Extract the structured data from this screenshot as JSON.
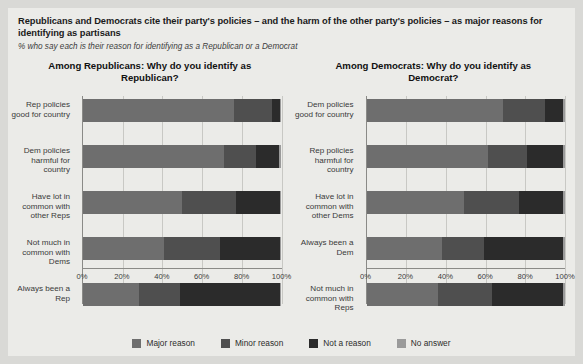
{
  "header": {
    "title": "Republicans and Democrats cite their party's policies – and the harm of the other party's policies – as major reasons for identifying as partisans",
    "subtitle": "% who say each is their reason for identifying as a Republican or a Democrat"
  },
  "colors": {
    "major_reason": "#6e6e6e",
    "minor_reason": "#4f4f4f",
    "not_a_reason": "#2b2b2b",
    "no_answer": "#9a9a9a",
    "panel_background": "#ebebe8",
    "page_background": "#d9d9d6",
    "axis": "#8a8a87",
    "gridline": "#c8c8c4"
  },
  "legend": {
    "position": "bottom",
    "items": [
      {
        "label": "Major reason",
        "color": "#6e6e6e",
        "key": "major_reason"
      },
      {
        "label": "Minor reason",
        "color": "#4f4f4f",
        "key": "minor_reason"
      },
      {
        "label": "Not a reason",
        "color": "#2b2b2b",
        "key": "not_a_reason"
      },
      {
        "label": "No answer",
        "color": "#9a9a9a",
        "key": "no_answer"
      }
    ]
  },
  "axis": {
    "ticks": [
      "0%",
      "20%",
      "40%",
      "60%",
      "80%",
      "100%"
    ],
    "tick_values": [
      0,
      20,
      40,
      60,
      80,
      100
    ],
    "min": 0,
    "max": 100
  },
  "chart_data": [
    {
      "type": "bar",
      "orientation": "horizontal",
      "stacked": true,
      "title": "Among Republicans: Why do you identify as Republican?",
      "xlabel": "",
      "ylabel": "",
      "xlim": [
        0,
        100
      ],
      "grid": true,
      "legend_position": "bottom",
      "categories": [
        "Rep policies good for country",
        "Dem policies harmful for country",
        "Have lot in common with other Reps",
        "Not much in common with Dems",
        "Always been a Rep"
      ],
      "series": [
        {
          "name": "Major reason",
          "values": [
            76,
            71,
            50,
            41,
            28
          ]
        },
        {
          "name": "Minor reason",
          "values": [
            19,
            16,
            27,
            28,
            21
          ]
        },
        {
          "name": "Not a reason",
          "values": [
            4,
            12,
            22,
            30,
            50
          ]
        },
        {
          "name": "No answer",
          "values": [
            1,
            1,
            1,
            1,
            1
          ]
        }
      ]
    },
    {
      "type": "bar",
      "orientation": "horizontal",
      "stacked": true,
      "title": "Among Democrats: Why do you identify as Democrat?",
      "xlabel": "",
      "ylabel": "",
      "xlim": [
        0,
        100
      ],
      "grid": true,
      "legend_position": "bottom",
      "categories": [
        "Dem policies good for country",
        "Rep policies harmful for country",
        "Have lot in common with other Dems",
        "Always been a Dem",
        "Not much in common with Reps"
      ],
      "series": [
        {
          "name": "Major reason",
          "values": [
            69,
            61,
            49,
            38,
            36
          ]
        },
        {
          "name": "Minor reason",
          "values": [
            21,
            20,
            28,
            21,
            27
          ]
        },
        {
          "name": "Not a reason",
          "values": [
            9,
            18,
            22,
            40,
            36
          ]
        },
        {
          "name": "No answer",
          "values": [
            1,
            1,
            1,
            1,
            1
          ]
        }
      ]
    }
  ]
}
